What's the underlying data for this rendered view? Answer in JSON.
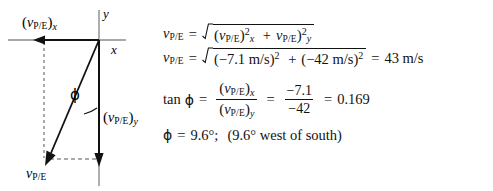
{
  "diagram": {
    "axis_labels": {
      "x": "x",
      "y": "y"
    },
    "angle_symbol": "ϕ",
    "vector_labels": {
      "x_component": {
        "open": "(",
        "symbol": "v",
        "sub": "P/E",
        "close": ")",
        "axis_sub": "x"
      },
      "y_component": {
        "open": "(",
        "symbol": "v",
        "sub": "P/E",
        "close": ")",
        "axis_sub": "y"
      },
      "resultant": {
        "symbol": "v",
        "sub": "P/E"
      }
    }
  },
  "equations": {
    "line1": {
      "lhs_symbol": "v",
      "lhs_sub": "P/E",
      "equals": "=",
      "radicand": {
        "term1_open": "(",
        "term1_symbol": "v",
        "term1_sub": "P/E",
        "term1_close": ")",
        "term1_sup": "2",
        "term1_axis": "x",
        "plus": "+",
        "term2_symbol": "v",
        "term2_sub": "P/E",
        "term2_close": ")",
        "term2_sup": "2",
        "term2_axis": "y"
      }
    },
    "line2": {
      "lhs_symbol": "v",
      "lhs_sub": "P/E",
      "equals": "=",
      "radicand": {
        "term1": "(−7.1 m/s)",
        "term1_sup": "2",
        "plus": "+",
        "term2": "(−42 m/s)",
        "term2_sup": "2"
      },
      "equals2": "=",
      "result": "43 m/s"
    },
    "line3": {
      "tan": "tan",
      "phi": "ϕ",
      "equals": "=",
      "frac1": {
        "num_open": "(",
        "num_symbol": "v",
        "num_sub": "P/E",
        "num_close": ")",
        "num_axis": "x",
        "den_open": "(",
        "den_symbol": "v",
        "den_sub": "P/E",
        "den_close": ")",
        "den_axis": "y"
      },
      "equals2": "=",
      "frac2": {
        "num": "−7.1",
        "den": "−42"
      },
      "equals3": "=",
      "result": "0.169"
    },
    "line4": {
      "phi": "ϕ",
      "equals": "=",
      "value": "9.6°;",
      "note": "(9.6° west of south)"
    }
  },
  "colors": {
    "ink": "#121212",
    "axis": "#6b6b6b",
    "background": "#ffffff"
  }
}
